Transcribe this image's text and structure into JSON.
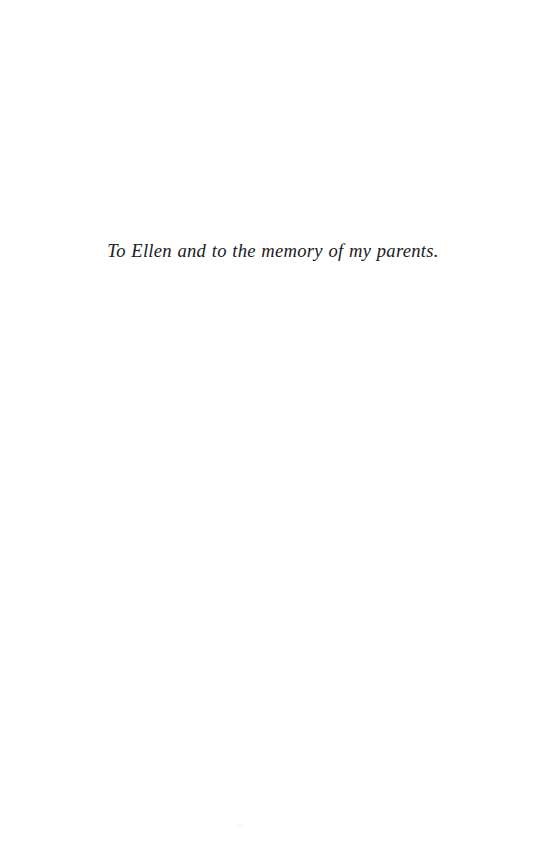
{
  "page": {
    "kind": "book-dedication-page",
    "background_color": "#ffffff",
    "width": 552,
    "height": 853
  },
  "dedication": {
    "text": "To Ellen and to the memory of my parents.",
    "style": "italic",
    "alignment": "center",
    "ink_color": "#1b1b1d"
  },
  "artifacts": {
    "scan_speck_color": "#fbfbfc"
  }
}
